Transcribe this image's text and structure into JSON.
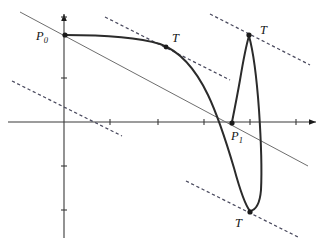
{
  "figure": {
    "title": "",
    "kind": "mathematical-curve-diagram",
    "background_color": "#ffffff",
    "colors": {
      "axis": "#3a3a3a",
      "curve": "#2b2b2b",
      "secant": "#6e6e6e",
      "dashed_tangent": "#4a4a5e",
      "marker": "#1b1b1b",
      "label": "#141414"
    }
  },
  "axes": {
    "x_axis": {
      "y": 122,
      "x_start": 8,
      "x_end": 316,
      "arrow": "right"
    },
    "y_axis": {
      "x": 64,
      "y_start": 14,
      "y_end": 238,
      "arrow": "up"
    },
    "origin": {
      "x": 64,
      "y": 122
    },
    "x_ticks": [
      110,
      158,
      204,
      250,
      296
    ],
    "y_ticks": [
      17,
      78,
      166,
      210
    ],
    "tick_half_length": 3
  },
  "labels": [
    {
      "name": "P0",
      "base": "P",
      "sub": "0",
      "x": 36,
      "y": 40
    },
    {
      "name": "P1",
      "base": "P",
      "sub": "1",
      "x": 231,
      "y": 140
    },
    {
      "name": "T-upper-middle",
      "base": "T",
      "sub": "",
      "x": 172,
      "y": 42
    },
    {
      "name": "T-top-right",
      "base": "T",
      "sub": "",
      "x": 260,
      "y": 34
    },
    {
      "name": "T-bottom",
      "base": "T",
      "sub": "",
      "x": 235,
      "y": 227
    }
  ],
  "marked_points": [
    {
      "name": "P0",
      "x": 65,
      "y": 35
    },
    {
      "name": "T-middle",
      "x": 166,
      "y": 47
    },
    {
      "name": "T-top",
      "x": 249,
      "y": 35
    },
    {
      "name": "P1",
      "x": 232,
      "y": 123
    },
    {
      "name": "T-bottom",
      "x": 250,
      "y": 212
    }
  ],
  "secant_line": {
    "name": "solid-secant-through-P0",
    "x1": 20,
    "y1": 12,
    "x2": 308,
    "y2": 166
  },
  "dashed_tangent_lines": [
    {
      "name": "dashed-tangent-top-left",
      "x1": 105,
      "y1": 17,
      "x2": 230,
      "y2": 80
    },
    {
      "name": "dashed-tangent-lower-left",
      "x1": 12,
      "y1": 81,
      "x2": 122,
      "y2": 136
    },
    {
      "name": "dashed-tangent-top-right",
      "x1": 210,
      "y1": 14,
      "x2": 310,
      "y2": 65
    },
    {
      "name": "dashed-tangent-bottom-right",
      "x1": 186,
      "y1": 181,
      "x2": 300,
      "y2": 238
    }
  ],
  "curve_segments": [
    {
      "name": "main-descending-branch",
      "path": "M 65 35 C 110 35 140 38 160 44 C 180 51 196 70 208 95 C 218 116 226 141 234 168 C 240 190 245 205 250 211"
    },
    {
      "name": "lower-cusp-return-branch",
      "path": "M 250 211 C 256 210 260 202 261 190 C 262 170 261 140 259 110 C 257 82 254 54 249 36"
    },
    {
      "name": "upper-cusp-down-to-P1",
      "path": "M 249 36 C 246 46 243 62 240 80 C 237 97 234 112 232 122"
    }
  ],
  "dash_pattern": "3.2 2.6",
  "stroke_widths": {
    "axis": 1.1,
    "curve": 2.0,
    "secant": 1.0,
    "dashed": 1.25
  }
}
